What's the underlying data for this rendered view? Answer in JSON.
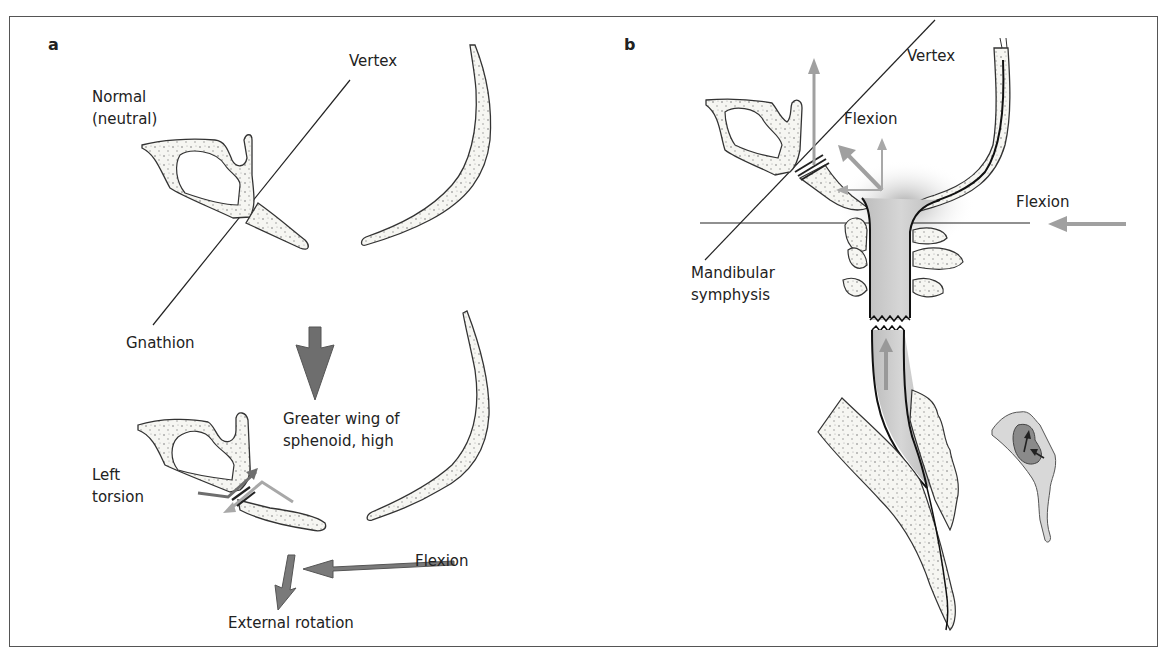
{
  "figure": {
    "panel_a": {
      "panel_label": "a",
      "labels": {
        "vertex": "Vertex",
        "normal_line1": "Normal",
        "normal_line2": "(neutral)",
        "gnathion": "Gnathion",
        "greater_wing_line1": "Greater wing of",
        "greater_wing_line2": "sphenoid, high",
        "left_torsion_line1": "Left",
        "left_torsion_line2": "torsion",
        "flexion": "Flexion",
        "external_rotation": "External rotation"
      }
    },
    "panel_b": {
      "panel_label": "b",
      "labels": {
        "vertex": "Vertex",
        "flexion_upper": "Flexion",
        "flexion_right": "Flexion",
        "mandibular_line1": "Mandibular",
        "mandibular_line2": "symphysis"
      }
    },
    "colors": {
      "outline": "#333333",
      "bone_fill": "#f4f4f0",
      "dark_arrow": "#707070",
      "light_arrow": "#a8a8a8",
      "dura_fill": "#c8c8c8"
    }
  }
}
